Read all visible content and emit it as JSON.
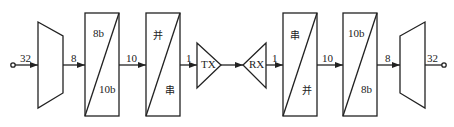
{
  "diagram": {
    "colors": {
      "stroke": "#222222",
      "background": "#ffffff"
    },
    "blocks": [
      {
        "id": "mux-in",
        "type": "mux",
        "label": ""
      },
      {
        "id": "enc",
        "type": "box",
        "top": "8b",
        "bottom": "10b"
      },
      {
        "id": "ser",
        "type": "box",
        "top": "并",
        "bottom": "串"
      },
      {
        "id": "tx",
        "type": "driver",
        "label": "TX"
      },
      {
        "id": "rx",
        "type": "receiver",
        "label": "RX"
      },
      {
        "id": "des",
        "type": "box",
        "top": "串",
        "bottom": "并"
      },
      {
        "id": "dec",
        "type": "box",
        "top": "10b",
        "bottom": "8b"
      },
      {
        "id": "mux-out",
        "type": "demux",
        "label": ""
      }
    ],
    "buses": {
      "in": "32",
      "mux_to_enc": "8",
      "enc_to_ser": "10",
      "ser_to_tx": "1",
      "rx_to_des": "1",
      "des_to_dec": "10",
      "dec_to_mux": "8",
      "out": "32"
    }
  }
}
